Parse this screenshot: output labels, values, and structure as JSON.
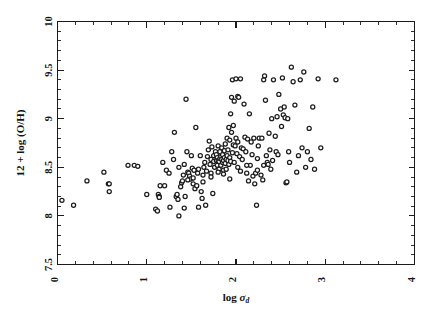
{
  "figure": {
    "background_color": "#ffffff",
    "ink_color": "#1b1b1b",
    "marker_edge_color": "#1d1d1d",
    "marker_fill_color": "#ffffff"
  },
  "axes": {
    "x_title_main": "log",
    "x_title_symbol": "σ",
    "x_title_subscript": "d",
    "y_title": "12 + log (O/H)",
    "x_tick_labels": [
      "0",
      "1",
      "2",
      "3",
      "4"
    ],
    "y_tick_labels": [
      "7.5",
      "8",
      "8.5",
      "9",
      "9.5",
      "10"
    ],
    "x_minor_per_interval": 4,
    "y_minor_per_interval": 4
  },
  "chart_data": {
    "type": "scatter",
    "title": "",
    "xlabel": "log σ_d",
    "ylabel": "12 + log (O/H)",
    "xlim": [
      0,
      4
    ],
    "ylim": [
      7.5,
      10
    ],
    "xticks": [
      0,
      1,
      2,
      3,
      4
    ],
    "yticks": [
      7.5,
      8,
      8.5,
      9,
      9.5,
      10
    ],
    "grid": false,
    "legend": "none",
    "marker": "open-circle",
    "n_points": 205,
    "x": [
      0.05,
      0.18,
      0.33,
      0.52,
      0.57,
      0.58,
      0.58,
      0.79,
      0.86,
      0.9,
      1.0,
      1.1,
      1.12,
      1.13,
      1.14,
      1.14,
      1.15,
      1.18,
      1.2,
      1.22,
      1.25,
      1.28,
      1.3,
      1.31,
      1.33,
      1.34,
      1.35,
      1.36,
      1.38,
      1.39,
      1.4,
      1.41,
      1.42,
      1.43,
      1.44,
      1.45,
      1.46,
      1.47,
      1.48,
      1.49,
      1.5,
      1.51,
      1.52,
      1.53,
      1.54,
      1.55,
      1.56,
      1.57,
      1.58,
      1.6,
      1.61,
      1.62,
      1.63,
      1.64,
      1.65,
      1.66,
      1.67,
      1.68,
      1.69,
      1.7,
      1.71,
      1.72,
      1.72,
      1.73,
      1.74,
      1.75,
      1.75,
      1.76,
      1.77,
      1.78,
      1.78,
      1.79,
      1.79,
      1.8,
      1.8,
      1.81,
      1.81,
      1.82,
      1.82,
      1.83,
      1.83,
      1.84,
      1.84,
      1.85,
      1.85,
      1.86,
      1.86,
      1.87,
      1.87,
      1.88,
      1.88,
      1.89,
      1.89,
      1.9,
      1.9,
      1.91,
      1.91,
      1.92,
      1.92,
      1.93,
      1.93,
      1.94,
      1.94,
      1.95,
      1.95,
      1.96,
      1.96,
      1.97,
      1.97,
      1.98,
      1.98,
      1.99,
      2.0,
      2.0,
      2.01,
      2.02,
      2.02,
      2.03,
      2.04,
      2.05,
      2.05,
      2.06,
      2.07,
      2.08,
      2.09,
      2.1,
      2.11,
      2.12,
      2.13,
      2.14,
      2.15,
      2.16,
      2.17,
      2.18,
      2.19,
      2.2,
      2.21,
      2.22,
      2.23,
      2.24,
      2.25,
      2.26,
      2.28,
      2.29,
      2.3,
      2.31,
      2.32,
      2.33,
      2.34,
      2.35,
      2.36,
      2.37,
      2.38,
      2.39,
      2.4,
      2.41,
      2.42,
      2.44,
      2.45,
      2.46,
      2.47,
      2.48,
      2.5,
      2.51,
      2.52,
      2.53,
      2.54,
      2.55,
      2.56,
      2.57,
      2.58,
      2.59,
      2.6,
      2.62,
      2.64,
      2.66,
      2.68,
      2.7,
      2.72,
      2.74,
      2.76,
      2.78,
      2.8,
      2.82,
      2.84,
      2.86,
      2.88,
      2.92,
      2.95,
      3.12,
      1.36,
      1.46,
      1.52,
      1.63,
      1.72,
      1.8,
      1.86,
      1.93,
      2.02,
      2.12,
      2.24,
      2.31,
      1.26,
      1.42,
      1.58
    ],
    "y": [
      8.16,
      8.11,
      8.36,
      8.45,
      8.33,
      8.33,
      8.25,
      8.52,
      8.52,
      8.51,
      8.22,
      8.07,
      8.05,
      8.22,
      8.2,
      8.19,
      8.31,
      8.55,
      8.31,
      8.47,
      8.44,
      8.66,
      8.58,
      8.86,
      8.2,
      8.22,
      8.17,
      8.0,
      8.3,
      8.34,
      8.36,
      8.42,
      8.53,
      8.2,
      9.2,
      8.66,
      8.45,
      8.44,
      8.41,
      8.38,
      8.62,
      8.49,
      8.33,
      8.47,
      8.28,
      8.91,
      8.31,
      8.44,
      8.48,
      8.62,
      8.25,
      8.18,
      8.42,
      8.5,
      8.55,
      8.11,
      8.46,
      8.61,
      8.68,
      8.77,
      8.53,
      8.58,
      8.44,
      8.71,
      8.23,
      8.56,
      8.62,
      8.5,
      8.66,
      8.57,
      8.63,
      8.6,
      8.52,
      8.57,
      8.72,
      8.56,
      8.48,
      8.59,
      8.66,
      8.52,
      8.61,
      8.58,
      8.7,
      8.55,
      8.63,
      8.57,
      8.47,
      8.6,
      8.67,
      8.54,
      8.74,
      8.58,
      8.48,
      8.62,
      8.8,
      8.57,
      8.68,
      8.53,
      8.91,
      8.6,
      8.78,
      9.05,
      8.56,
      8.86,
      9.22,
      8.65,
      9.4,
      8.93,
      8.73,
      9.18,
      8.55,
      8.72,
      9.41,
      8.8,
      8.64,
      9.23,
      8.76,
      9.22,
      8.61,
      8.46,
      9.41,
      8.7,
      8.58,
      8.69,
      9.15,
      8.81,
      8.66,
      8.44,
      8.79,
      8.36,
      9.05,
      8.52,
      8.76,
      8.63,
      8.41,
      8.8,
      8.33,
      8.44,
      8.11,
      8.59,
      8.72,
      8.8,
      8.42,
      8.8,
      8.37,
      9.4,
      9.44,
      9.19,
      8.62,
      8.55,
      8.53,
      8.85,
      8.68,
      8.48,
      9.0,
      8.57,
      9.4,
      8.82,
      8.66,
      9.02,
      8.63,
      9.25,
      9.1,
      8.92,
      9.42,
      9.04,
      9.12,
      9.01,
      8.34,
      8.35,
      9.0,
      8.66,
      8.55,
      9.53,
      9.38,
      9.14,
      8.45,
      8.62,
      9.4,
      8.7,
      9.48,
      8.5,
      8.66,
      8.9,
      8.58,
      9.12,
      8.48,
      9.41,
      8.7,
      9.4,
      8.5,
      8.37,
      8.39,
      8.35,
      8.4,
      8.45,
      8.43,
      8.38,
      8.5,
      8.52,
      8.47,
      8.52,
      8.09,
      8.08,
      8.09
    ]
  }
}
